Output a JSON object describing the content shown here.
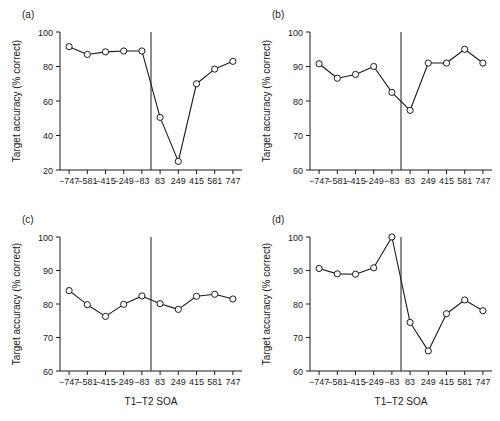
{
  "figure": {
    "background_color": "#ffffff",
    "ink_color": "#1a1a1a",
    "marker_fill": "#ffffff"
  },
  "chart_data": [
    {
      "type": "line",
      "panel_label": "(a)",
      "title": "",
      "xlabel": "",
      "ylabel": "Target accuracy (% correct)",
      "x": [
        -747,
        -581,
        -415,
        -249,
        -83,
        83,
        249,
        415,
        581,
        747
      ],
      "xtick_labels": [
        "-747",
        "-581",
        "-415",
        "-249",
        "-83",
        "83",
        "249",
        "415",
        "581",
        "747"
      ],
      "values": [
        91.5,
        87.0,
        88.5,
        89.0,
        89.0,
        50.5,
        25.0,
        70.0,
        78.5,
        83.0
      ],
      "ytick_labels": [
        "20",
        "40",
        "60",
        "80",
        "100"
      ],
      "yticks": [
        20,
        40,
        60,
        80,
        100
      ],
      "ylim": [
        20,
        100
      ],
      "grid": false,
      "legend": "none",
      "annotations": [
        "vertical divider line between -83 and 83"
      ]
    },
    {
      "type": "line",
      "panel_label": "(b)",
      "title": "",
      "xlabel": "",
      "ylabel": "Target accuracy (% correct)",
      "x": [
        -747,
        -581,
        -415,
        -249,
        -83,
        83,
        249,
        415,
        581,
        747
      ],
      "xtick_labels": [
        "-747",
        "-581",
        "-415",
        "-249",
        "-83",
        "83",
        "249",
        "415",
        "581",
        "747"
      ],
      "values": [
        90.8,
        86.6,
        87.7,
        90.0,
        82.5,
        77.3,
        91.0,
        91.0,
        95.0,
        91.0
      ],
      "ytick_labels": [
        "60",
        "70",
        "80",
        "90",
        "100"
      ],
      "yticks": [
        60,
        70,
        80,
        90,
        100
      ],
      "ylim": [
        60,
        100
      ],
      "grid": false,
      "legend": "none",
      "annotations": [
        "vertical divider line between -83 and 83"
      ]
    },
    {
      "type": "line",
      "panel_label": "(c)",
      "title": "",
      "xlabel": "T1–T2 SOA",
      "ylabel": "Target accuracy (% correct)",
      "x": [
        -747,
        -581,
        -415,
        -249,
        -83,
        83,
        249,
        415,
        581,
        747
      ],
      "xtick_labels": [
        "-747",
        "-581",
        "-415",
        "-249",
        "-83",
        "83",
        "249",
        "415",
        "581",
        "747"
      ],
      "values": [
        84.0,
        79.8,
        76.3,
        79.9,
        82.4,
        80.1,
        78.4,
        82.3,
        82.9,
        81.5
      ],
      "ytick_labels": [
        "60",
        "70",
        "80",
        "90",
        "100"
      ],
      "yticks": [
        60,
        70,
        80,
        90,
        100
      ],
      "ylim": [
        60,
        100
      ],
      "grid": false,
      "legend": "none",
      "annotations": [
        "vertical divider line between -83 and 83"
      ]
    },
    {
      "type": "line",
      "panel_label": "(d)",
      "title": "",
      "xlabel": "T1–T2 SOA",
      "ylabel": "Target accuracy (% correct)",
      "x": [
        -747,
        -581,
        -415,
        -249,
        -83,
        83,
        249,
        415,
        581,
        747
      ],
      "xtick_labels": [
        "-747",
        "-581",
        "-415",
        "-249",
        "-83",
        "83",
        "249",
        "415",
        "581",
        "747"
      ],
      "values": [
        90.6,
        89.0,
        88.9,
        90.8,
        100.0,
        74.5,
        66.0,
        77.1,
        81.2,
        78.0
      ],
      "ytick_labels": [
        "60",
        "70",
        "80",
        "90",
        "100"
      ],
      "yticks": [
        60,
        70,
        80,
        90,
        100
      ],
      "ylim": [
        60,
        100
      ],
      "grid": false,
      "legend": "none",
      "annotations": [
        "vertical divider line between -83 and 83"
      ]
    }
  ]
}
